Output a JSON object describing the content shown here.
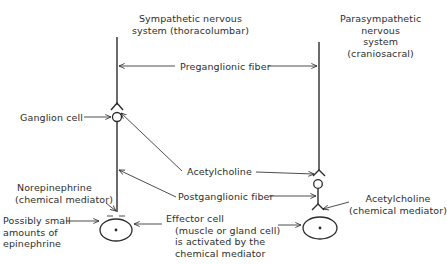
{
  "diagram": {
    "title_sympathetic": {
      "line1": "Sympathetic nervous",
      "line2": "system (thoracolumbar)"
    },
    "title_parasympathetic": {
      "line1": "Parasympathetic",
      "line2": "nervous",
      "line3": "system",
      "line4": "(craniosacral)"
    },
    "labels": {
      "preganglionic": "Preganglionic fiber",
      "ganglion_cell": "Ganglion cell",
      "acetylcholine_center": "Acetylcholine",
      "postganglionic": "Postganglionic fiber",
      "norepinephrine_line1": "Norepinephrine",
      "norepinephrine_line2": "(chemical mediator)",
      "epinephrine_line1": "Possibly small",
      "epinephrine_line2": "amounts of",
      "epinephrine_line3": "epinephrine",
      "effector_line1": "Effector cell",
      "effector_line2": "(muscle or gland cell)",
      "effector_line3": "is activated by the",
      "effector_line4": "chemical mediator",
      "acetylcholine_right_line1": "Acetylcholine",
      "acetylcholine_right_line2": "(chemical mediator)"
    },
    "elements": [
      "sympathetic-preganglionic-fiber",
      "sympathetic-ganglion-cell",
      "sympathetic-postganglionic-fiber",
      "sympathetic-effector-cell",
      "parasympathetic-preganglionic-fiber",
      "parasympathetic-ganglion-cell",
      "parasympathetic-postganglionic-fiber",
      "parasympathetic-effector-cell"
    ],
    "colors": {
      "ink": "#2b2b2b",
      "background": "#ffffff"
    }
  }
}
